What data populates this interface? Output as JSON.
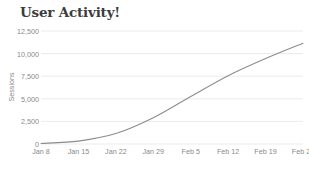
{
  "chart_data": {
    "type": "line",
    "title": "User Activity!",
    "xlabel": "",
    "ylabel": "Sessions",
    "categories": [
      "Jan 8",
      "Jan 15",
      "Jan 22",
      "Jan 29",
      "Feb 5",
      "Feb 12",
      "Feb 19",
      "Feb 26"
    ],
    "x": [
      "Jan 8",
      "Jan 15",
      "Jan 22",
      "Jan 29",
      "Feb 5",
      "Feb 12",
      "Feb 19",
      "Feb 26"
    ],
    "values": [
      60,
      320,
      1150,
      2900,
      5250,
      7550,
      9450,
      11150
    ],
    "series": [
      {
        "name": "Sessions",
        "values": [
          60,
          320,
          1150,
          2900,
          5250,
          7550,
          9450,
          11150
        ],
        "color": "#8c8c8c"
      }
    ],
    "yticks": [
      0,
      2500,
      5000,
      7500,
      10000,
      12500
    ],
    "ytick_labels": [
      "0",
      "2,500",
      "5,000",
      "7,500",
      "10,000",
      "12,500"
    ],
    "ylim": [
      0,
      12500
    ],
    "grid": "horizontal",
    "legend": "none",
    "line_color": "#8c8c8c",
    "grid_color": "#ebebeb",
    "title_color": "#3c3c3c",
    "tick_color": "#8a8a8a",
    "background": "#ffffff"
  }
}
